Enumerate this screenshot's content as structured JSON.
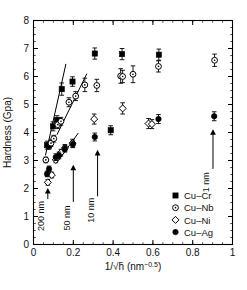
{
  "chart_data": {
    "type": "scatter",
    "title": "",
    "xlabel": "1/√h̄ (nm−0.5)",
    "xlabel_main": "1/",
    "xlabel_radical": "√h̄",
    "xlabel_unit_base": " (nm",
    "xlabel_unit_sup": "−0.5",
    "xlabel_unit_close": ")",
    "ylabel": "Hardness (Gpa)",
    "xlim": [
      0,
      1
    ],
    "ylim": [
      0,
      8
    ],
    "xticks": [
      "0",
      "0.2",
      "0.4",
      "0.6",
      "0.8",
      "1"
    ],
    "xtick_values": [
      0,
      0.2,
      0.4,
      0.6,
      0.8,
      1
    ],
    "yticks": [
      "0",
      "1",
      "2",
      "3",
      "4",
      "5",
      "6",
      "7",
      "8"
    ],
    "ytick_values": [
      0,
      1,
      2,
      3,
      4,
      5,
      6,
      7,
      8
    ],
    "grid": false,
    "legend_position": "lower-right",
    "minor_ticks_x": 0.05,
    "minor_ticks_y": 0.25,
    "series": [
      {
        "name": "Cu–Cr",
        "marker": "filled-square",
        "color": "#000000",
        "points": [
          {
            "x": 0.068,
            "y": 3.55,
            "err": 0.14
          },
          {
            "x": 0.078,
            "y": 3.52,
            "err": 0.12
          },
          {
            "x": 0.098,
            "y": 4.22,
            "err": 0.16
          },
          {
            "x": 0.118,
            "y": 4.45,
            "err": 0.15
          },
          {
            "x": 0.142,
            "y": 5.55,
            "err": 0.22
          },
          {
            "x": 0.196,
            "y": 5.82,
            "err": 0.17
          },
          {
            "x": 0.308,
            "y": 6.82,
            "err": 0.2
          },
          {
            "x": 0.388,
            "y": 4.08,
            "err": 0.16
          },
          {
            "x": 0.445,
            "y": 6.8,
            "err": 0.2
          },
          {
            "x": 0.63,
            "y": 6.78,
            "err": 0.2
          }
        ]
      },
      {
        "name": "Cu–Nb",
        "marker": "dotted-circle",
        "color": "#000000",
        "points": [
          {
            "x": 0.062,
            "y": 3.02,
            "err": 0.1
          },
          {
            "x": 0.088,
            "y": 3.62,
            "err": 0.12
          },
          {
            "x": 0.102,
            "y": 3.78,
            "err": 0.12
          },
          {
            "x": 0.122,
            "y": 4.28,
            "err": 0.14
          },
          {
            "x": 0.138,
            "y": 4.4,
            "err": 0.14
          },
          {
            "x": 0.178,
            "y": 5.08,
            "err": 0.16
          },
          {
            "x": 0.212,
            "y": 5.3,
            "err": 0.16
          },
          {
            "x": 0.258,
            "y": 5.7,
            "err": 0.24
          },
          {
            "x": 0.318,
            "y": 5.68,
            "err": 0.22
          },
          {
            "x": 0.438,
            "y": 6.02,
            "err": 0.26
          },
          {
            "x": 0.5,
            "y": 6.08,
            "err": 0.3
          },
          {
            "x": 0.448,
            "y": 6.0,
            "err": 0.22
          },
          {
            "x": 0.628,
            "y": 6.36,
            "err": 0.2
          },
          {
            "x": 0.91,
            "y": 6.58,
            "err": 0.22
          }
        ]
      },
      {
        "name": "Cu–Ni",
        "marker": "open-diamond",
        "color": "#000000",
        "points": [
          {
            "x": 0.072,
            "y": 2.22,
            "err": 0.1
          },
          {
            "x": 0.092,
            "y": 2.48,
            "err": 0.1
          },
          {
            "x": 0.112,
            "y": 3.02,
            "err": 0.1
          },
          {
            "x": 0.138,
            "y": 3.28,
            "err": 0.12
          },
          {
            "x": 0.158,
            "y": 3.45,
            "err": 0.12
          },
          {
            "x": 0.196,
            "y": 3.62,
            "err": 0.14
          },
          {
            "x": 0.305,
            "y": 4.48,
            "err": 0.18
          },
          {
            "x": 0.448,
            "y": 4.86,
            "err": 0.2
          },
          {
            "x": 0.578,
            "y": 4.32,
            "err": 0.18
          },
          {
            "x": 0.595,
            "y": 4.3,
            "err": 0.16
          }
        ]
      },
      {
        "name": "Cu–Ag",
        "marker": "filled-circle",
        "color": "#000000",
        "points": [
          {
            "x": 0.068,
            "y": 2.52,
            "err": 0.1
          },
          {
            "x": 0.078,
            "y": 2.7,
            "err": 0.1
          },
          {
            "x": 0.112,
            "y": 3.12,
            "err": 0.12
          },
          {
            "x": 0.128,
            "y": 3.18,
            "err": 0.12
          },
          {
            "x": 0.158,
            "y": 3.42,
            "err": 0.12
          },
          {
            "x": 0.198,
            "y": 3.58,
            "err": 0.12
          },
          {
            "x": 0.308,
            "y": 3.84,
            "err": 0.14
          },
          {
            "x": 0.628,
            "y": 4.48,
            "err": 0.16
          },
          {
            "x": 0.908,
            "y": 4.58,
            "err": 0.16
          }
        ]
      }
    ],
    "fit_lines": [
      {
        "name": "fit-cu-cr",
        "x1": 0.06,
        "y1": 3.18,
        "x2": 0.163,
        "y2": 6.45
      },
      {
        "name": "fit-cu-nb",
        "x1": 0.118,
        "y1": 3.92,
        "x2": 0.268,
        "y2": 6.1
      },
      {
        "name": "fit-cu-ni",
        "x1": 0.12,
        "y1": 2.95,
        "x2": 0.225,
        "y2": 3.98
      }
    ],
    "annotations": [
      {
        "label": "200 nm",
        "x": 0.072,
        "y_base": 1.62,
        "y_tip": 2.02,
        "text_y": 1.02
      },
      {
        "label": "50 nm",
        "x": 0.2,
        "y_base": 1.52,
        "y_tip": 2.85,
        "text_y": 0.95
      },
      {
        "label": "10 nm",
        "x": 0.322,
        "y_base": 1.72,
        "y_tip": 3.38,
        "text_y": 1.22
      },
      {
        "label": "1 nm",
        "x": 0.902,
        "y_base": 2.7,
        "y_tip": 4.12,
        "text_y": 2.22
      }
    ],
    "legend": [
      {
        "label": "Cu–Cr",
        "marker": "filled-square"
      },
      {
        "label": "Cu–Nb",
        "marker": "dotted-circle"
      },
      {
        "label": "Cu–Ni",
        "marker": "open-diamond"
      },
      {
        "label": "Cu–Ag",
        "marker": "filled-circle"
      }
    ]
  }
}
